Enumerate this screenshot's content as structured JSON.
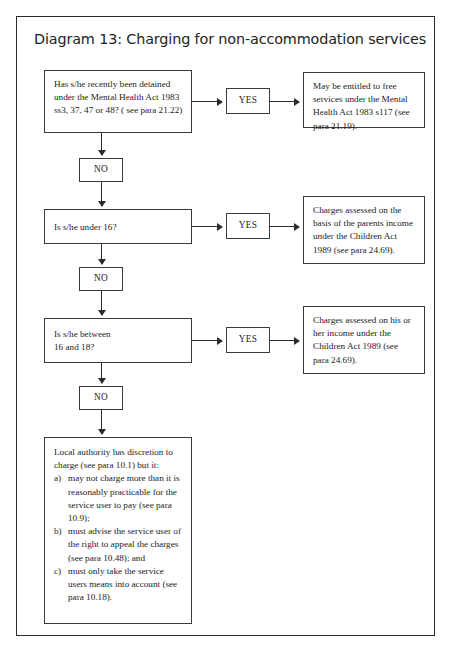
{
  "document": {
    "title": "Diagram 13: Charging for non-accommodation services"
  },
  "flow": {
    "decision_1": {
      "id": "decision-detained-mental-health",
      "text": "Has s/he recently been detained under the Mental Health Act 1983 ss3, 37, 47 or 48? ( see para 21.22)"
    },
    "yes_1": {
      "label": "YES"
    },
    "outcome_1": {
      "id": "outcome-free-services",
      "text": "May be entitled to free services under the Mental Health Act 1983 s117 (see para 21.19)."
    },
    "no_1": {
      "label": "NO"
    },
    "decision_2": {
      "id": "decision-under-16",
      "text": "Is s/he under 16?"
    },
    "yes_2": {
      "label": "YES"
    },
    "outcome_2": {
      "id": "outcome-parents-income",
      "text": "Charges assessed on the basis of the parents income under the Children Act 1989 (see para 24.69)."
    },
    "no_2": {
      "label": "NO"
    },
    "decision_3": {
      "id": "decision-between-16-and-18",
      "line1": "Is s/he between",
      "line2": "16 and 18?"
    },
    "yes_3": {
      "label": "YES"
    },
    "outcome_3": {
      "id": "outcome-own-income",
      "text": "Charges assessed on his or her income under the Children Act 1989 (see para 24.69)."
    },
    "no_3": {
      "label": "NO"
    },
    "outcome_final": {
      "id": "outcome-local-authority-discretion",
      "intro": "Local authority has discretion to charge (see para 10.1) but it:",
      "items": [
        {
          "marker": "a)",
          "text": "may not charge more than it is reasonably practicable for the service user to pay (see para 10.9);"
        },
        {
          "marker": "b)",
          "text": "must advise the service user of the right to appeal the charges (see para 10.48); and"
        },
        {
          "marker": "c)",
          "text": "must only take the service users means into account (see para 10.18)."
        }
      ]
    }
  },
  "colors": {
    "ink": "#1c1c1c",
    "rule": "#2b2b2b",
    "page": "#ffffff"
  }
}
